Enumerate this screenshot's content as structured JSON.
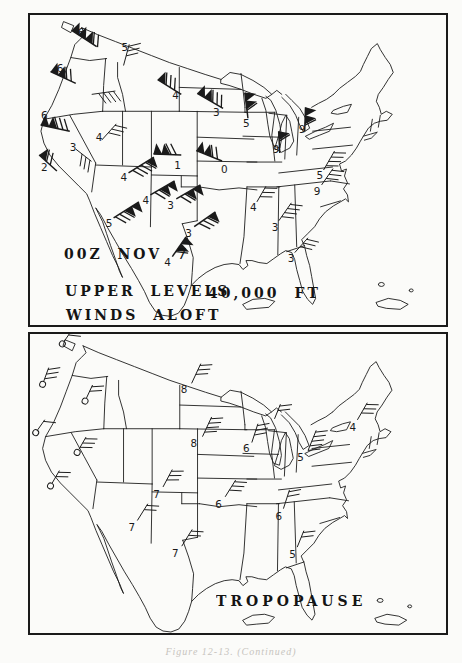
{
  "page": {
    "caption": "Figure 12-13. (Continued)",
    "colors": {
      "ink": "#1a1a1a",
      "paper": "#fbfbf9",
      "caption_ink": "#c7c4be"
    }
  },
  "top_panel": {
    "labels": {
      "time": "00Z NOV 7",
      "line1": "UPPER LEVELS",
      "line2": "WINDS ALOFT",
      "altitude": "40,000 FT"
    },
    "stations": [
      {
        "num": "6",
        "x": 48,
        "y": 11,
        "bx": 67,
        "by": 31,
        "rot": -147,
        "p": 3,
        "b": 2,
        "t": "p",
        "len": 30
      },
      {
        "num": "5",
        "x": 92,
        "y": 26,
        "bx": 94,
        "by": 50,
        "rot": -75,
        "p": 0,
        "b": 3,
        "t": "l",
        "len": 22
      },
      {
        "num": "6",
        "x": 27,
        "y": 48,
        "bx": 46,
        "by": 68,
        "rot": -155,
        "p": 2,
        "b": 2,
        "t": "p",
        "len": 28
      },
      {
        "num": "",
        "x": 0,
        "y": 0,
        "bx": 62,
        "by": 79,
        "rot": -8,
        "p": 0,
        "b": 4,
        "t": "l",
        "len": 24
      },
      {
        "num": "4",
        "x": 143,
        "y": 75,
        "bx": 152,
        "by": 79,
        "rot": -148,
        "p": 1,
        "b": 3,
        "t": "p",
        "len": 28
      },
      {
        "num": "3",
        "x": 184,
        "y": 92,
        "bx": 194,
        "by": 93,
        "rot": -150,
        "p": 2,
        "b": 3,
        "t": "p",
        "len": 30
      },
      {
        "num": "5",
        "x": 214,
        "y": 103,
        "bx": 219,
        "by": 103,
        "rot": -97,
        "p": 2,
        "b": 1,
        "t": "p",
        "len": 26
      },
      {
        "num": "6",
        "x": 11,
        "y": 95,
        "bx": 40,
        "by": 116,
        "rot": -168,
        "p": 2,
        "b": 3,
        "t": "p",
        "len": 30
      },
      {
        "num": "4",
        "x": 66,
        "y": 117,
        "bx": 72,
        "by": 125,
        "rot": -48,
        "p": 0,
        "b": 3,
        "t": "l",
        "len": 22
      },
      {
        "num": "3",
        "x": 40,
        "y": 127,
        "bx": 46,
        "by": 134,
        "rot": 38,
        "p": 0,
        "b": 3,
        "t": "l",
        "len": 20
      },
      {
        "num": "2",
        "x": 11,
        "y": 147,
        "bx": 27,
        "by": 156,
        "rot": -138,
        "p": 1,
        "b": 2,
        "t": "p",
        "len": 24
      },
      {
        "num": "5",
        "x": 76,
        "y": 203,
        "bx": 84,
        "by": 203,
        "rot": -32,
        "p": 2,
        "b": 3,
        "t": "p",
        "len": 30
      },
      {
        "num": "4",
        "x": 91,
        "y": 157,
        "bx": 99,
        "by": 158,
        "rot": -32,
        "p": 1,
        "b": 4,
        "t": "p",
        "len": 30
      },
      {
        "num": "4",
        "x": 113,
        "y": 180,
        "bx": 121,
        "by": 180,
        "rot": -30,
        "p": 2,
        "b": 2,
        "t": "p",
        "len": 28
      },
      {
        "num": "3",
        "x": 138,
        "y": 185,
        "bx": 147,
        "by": 184,
        "rot": -30,
        "p": 2,
        "b": 2,
        "t": "p",
        "len": 28
      },
      {
        "num": "1",
        "x": 145,
        "y": 145,
        "bx": 152,
        "by": 140,
        "rot": -178,
        "p": 2,
        "b": 2,
        "t": "p",
        "len": 28
      },
      {
        "num": "0",
        "x": 192,
        "y": 149,
        "bx": 193,
        "by": 146,
        "rot": -158,
        "p": 2,
        "b": 2,
        "t": "p",
        "len": 28
      },
      {
        "num": "9",
        "x": 244,
        "y": 129,
        "bx": 251,
        "by": 138,
        "rot": -93,
        "p": 1,
        "b": 1,
        "t": "p",
        "len": 22
      },
      {
        "num": "9",
        "x": 270,
        "y": 109,
        "bx": 276,
        "by": 116,
        "rot": -88,
        "p": 2,
        "b": 1,
        "t": "p",
        "len": 24
      },
      {
        "num": "5",
        "x": 288,
        "y": 155,
        "bx": 295,
        "by": 155,
        "rot": -60,
        "p": 0,
        "b": 4,
        "t": "l",
        "len": 22
      },
      {
        "num": "9",
        "x": 285,
        "y": 171,
        "bx": 293,
        "by": 170,
        "rot": -55,
        "p": 0,
        "b": 3,
        "t": "l",
        "len": 20
      },
      {
        "num": "4",
        "x": 221,
        "y": 187,
        "bx": 228,
        "by": 187,
        "rot": -60,
        "p": 0,
        "b": 3,
        "t": "l",
        "len": 18
      },
      {
        "num": "3",
        "x": 243,
        "y": 207,
        "bx": 250,
        "by": 206,
        "rot": -55,
        "p": 0,
        "b": 4,
        "t": "l",
        "len": 22
      },
      {
        "num": "3",
        "x": 259,
        "y": 238,
        "bx": 266,
        "by": 238,
        "rot": -48,
        "p": 0,
        "b": 3,
        "t": "l",
        "len": 20
      },
      {
        "num": "3",
        "x": 156,
        "y": 213,
        "bx": 165,
        "by": 212,
        "rot": -35,
        "p": 1,
        "b": 3,
        "t": "p",
        "len": 26
      },
      {
        "num": "4",
        "x": 135,
        "y": 242,
        "bx": 143,
        "by": 242,
        "rot": -55,
        "p": 2,
        "b": 1,
        "t": "p",
        "len": 24
      }
    ]
  },
  "bottom_panel": {
    "labels": {
      "title": "TROPOPAUSE"
    },
    "stations": [
      {
        "num": "",
        "x": 0,
        "y": 0,
        "bx": 31,
        "by": 10,
        "rot": -55,
        "p": 0,
        "b": 2,
        "t": "c",
        "len": 18
      },
      {
        "num": "",
        "x": 0,
        "y": 0,
        "bx": 11,
        "by": 51,
        "rot": -70,
        "p": 0,
        "b": 3,
        "t": "c",
        "len": 18
      },
      {
        "num": "",
        "x": 0,
        "y": 0,
        "bx": 54,
        "by": 68,
        "rot": -65,
        "p": 0,
        "b": 2,
        "t": "c",
        "len": 18
      },
      {
        "num": "",
        "x": 0,
        "y": 0,
        "bx": 4,
        "by": 100,
        "rot": -55,
        "p": 0,
        "b": 1,
        "t": "c",
        "len": 16
      },
      {
        "num": "",
        "x": 0,
        "y": 0,
        "bx": 46,
        "by": 120,
        "rot": -60,
        "p": 0,
        "b": 3,
        "t": "c",
        "len": 18
      },
      {
        "num": "",
        "x": 0,
        "y": 0,
        "bx": 19,
        "by": 154,
        "rot": -60,
        "p": 0,
        "b": 2,
        "t": "c",
        "len": 18
      },
      {
        "num": "8",
        "x": 151,
        "y": 51,
        "bx": 162,
        "by": 50,
        "rot": -65,
        "p": 0,
        "b": 3,
        "t": "l",
        "len": 22
      },
      {
        "num": "8",
        "x": 161,
        "y": 106,
        "bx": 173,
        "by": 104,
        "rot": -65,
        "p": 0,
        "b": 4,
        "t": "l",
        "len": 22
      },
      {
        "num": "6",
        "x": 214,
        "y": 111,
        "bx": 223,
        "by": 110,
        "rot": -72,
        "p": 0,
        "b": 3,
        "t": "l",
        "len": 20
      },
      {
        "num": "5",
        "x": 269,
        "y": 120,
        "bx": 280,
        "by": 118,
        "rot": -68,
        "p": 0,
        "b": 5,
        "t": "l",
        "len": 22
      },
      {
        "num": "4",
        "x": 322,
        "y": 89,
        "bx": 330,
        "by": 87,
        "rot": -60,
        "p": 0,
        "b": 3,
        "t": "l",
        "len": 20
      },
      {
        "num": "7",
        "x": 123,
        "y": 157,
        "bx": 133,
        "by": 155,
        "rot": -62,
        "p": 0,
        "b": 3,
        "t": "l",
        "len": 20
      },
      {
        "num": "6",
        "x": 186,
        "y": 167,
        "bx": 196,
        "by": 165,
        "rot": -58,
        "p": 0,
        "b": 3,
        "t": "l",
        "len": 20
      },
      {
        "num": "7",
        "x": 98,
        "y": 191,
        "bx": 107,
        "by": 189,
        "rot": -58,
        "p": 0,
        "b": 2,
        "t": "l",
        "len": 20
      },
      {
        "num": "7",
        "x": 142,
        "y": 217,
        "bx": 152,
        "by": 215,
        "rot": -58,
        "p": 0,
        "b": 2,
        "t": "l",
        "len": 20
      },
      {
        "num": "6",
        "x": 247,
        "y": 179,
        "bx": 255,
        "by": 177,
        "rot": -72,
        "p": 0,
        "b": 2,
        "t": "l",
        "len": 20
      },
      {
        "num": "5",
        "x": 261,
        "y": 218,
        "bx": 269,
        "by": 216,
        "rot": -68,
        "p": 0,
        "b": 2,
        "t": "l",
        "len": 18
      },
      {
        "num": "",
        "x": 0,
        "y": 0,
        "bx": 246,
        "by": 86,
        "rot": -68,
        "p": 0,
        "b": 2,
        "t": "l",
        "len": 16
      }
    ]
  }
}
